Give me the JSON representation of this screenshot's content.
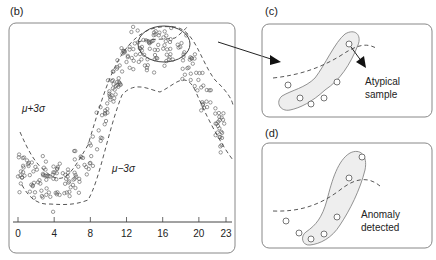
{
  "panels": {
    "b": {
      "label": "(b)",
      "upper_bound_label": "μ+3σ",
      "lower_bound_label": "μ−3σ",
      "x_ticks": [
        "0",
        "4",
        "8",
        "12",
        "16",
        "20",
        "23"
      ]
    },
    "c": {
      "label": "(c)",
      "annotation_line1": "Atypical",
      "annotation_line2": "sample"
    },
    "d": {
      "label": "(d)",
      "annotation_line1": "Anomaly",
      "annotation_line2": "detected"
    }
  },
  "chart_data": {
    "type": "scatter",
    "title": "",
    "xlabel": "",
    "ylabel": "",
    "xlim": [
      0,
      23
    ],
    "x_ticks": [
      0,
      4,
      8,
      12,
      16,
      20,
      23
    ],
    "series": [
      {
        "name": "samples",
        "description": "daily-profile observations"
      },
      {
        "name": "μ+3σ",
        "style": "dashed"
      },
      {
        "name": "μ−3σ",
        "style": "dashed"
      }
    ],
    "mean_profile_x": [
      0,
      2,
      4,
      6,
      8,
      10,
      12,
      14,
      16,
      18,
      20,
      22,
      23
    ],
    "mean_profile_y": [
      0.25,
      0.2,
      0.15,
      0.18,
      0.3,
      0.6,
      0.85,
      0.9,
      0.92,
      0.88,
      0.7,
      0.5,
      0.4
    ]
  }
}
